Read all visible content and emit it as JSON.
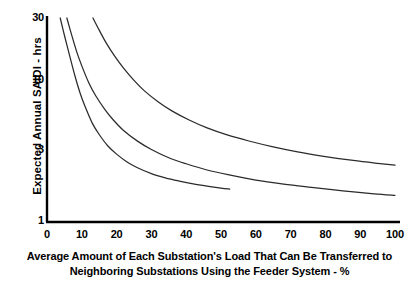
{
  "chart_data": {
    "type": "line",
    "title": "",
    "xlabel": "Average Amount of Each Substation's Load That Can Be Transferred to Neighboring Substations Using the Feeder System - %",
    "xlabel_line1": "Average Amount of Each Substation's Load That Can Be Transferred to",
    "xlabel_line2": "Neighboring Substations Using the Feeder System - %",
    "ylabel": "Expected Annual SAIDI - hrs",
    "xlim": [
      0,
      104
    ],
    "ylim": [
      1,
      30
    ],
    "yscale": "log",
    "xscale": "linear",
    "grid": false,
    "legend": "none",
    "xticks": [
      0,
      10,
      20,
      30,
      40,
      50,
      60,
      70,
      80,
      90,
      100
    ],
    "xtick_labels": [
      "0",
      "10",
      "20",
      "30",
      "40",
      "50",
      "60",
      "70",
      "80",
      "90",
      "100"
    ],
    "yticks": [
      1,
      3,
      10,
      30
    ],
    "ytick_labels": [
      "1",
      "3",
      "10",
      "30"
    ],
    "line_color": "#2b2b2b",
    "axis_color": "#000000",
    "series": [
      {
        "name": "curve-lower",
        "x": [
          3.8,
          5.0,
          6.5,
          8.0,
          9.5,
          11.0,
          13.0,
          15.0,
          17.5,
          20.0,
          23.0,
          26.0,
          30.0,
          34.0,
          38.0,
          42.0,
          46.0,
          50.0,
          52.5
        ],
        "y": [
          30.0,
          22.5,
          16.0,
          11.5,
          8.6,
          6.8,
          5.2,
          4.3,
          3.55,
          3.1,
          2.72,
          2.47,
          2.24,
          2.09,
          1.98,
          1.89,
          1.82,
          1.76,
          1.73
        ]
      },
      {
        "name": "curve-middle",
        "x": [
          5.7,
          7.0,
          8.5,
          10.0,
          12.0,
          14.0,
          16.5,
          19.0,
          22.0,
          26.0,
          30.0,
          35.0,
          40.0,
          46.0,
          52.0,
          60.0,
          68.0,
          76.0,
          85.0,
          94.0,
          100.0
        ],
        "y": [
          30.0,
          23.0,
          17.2,
          13.5,
          10.2,
          8.2,
          6.6,
          5.5,
          4.6,
          3.85,
          3.35,
          2.92,
          2.64,
          2.38,
          2.2,
          2.01,
          1.88,
          1.78,
          1.68,
          1.6,
          1.56
        ]
      },
      {
        "name": "curve-upper",
        "x": [
          13.2,
          15.0,
          17.0,
          19.5,
          22.0,
          25.0,
          28.0,
          32.0,
          36.0,
          41.0,
          46.0,
          52.0,
          58.0,
          65.0,
          72.0,
          80.0,
          88.0,
          95.0,
          100.0
        ],
        "y": [
          30.0,
          24.5,
          19.8,
          15.8,
          13.0,
          10.6,
          8.9,
          7.4,
          6.35,
          5.45,
          4.8,
          4.25,
          3.86,
          3.5,
          3.22,
          2.98,
          2.79,
          2.66,
          2.58
        ]
      }
    ]
  },
  "axes_geometry": {
    "x0_px": 47,
    "x100_px": 395,
    "y_top_value": 30,
    "y_top_px": 18,
    "y_bottom_value": 1,
    "y_bottom_px": 222
  }
}
